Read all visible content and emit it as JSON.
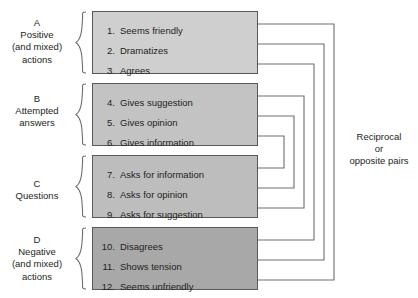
{
  "diagram": {
    "categories": [
      {
        "letter": "A",
        "lines": [
          "Positive",
          "(and mixed)",
          "actions"
        ],
        "box_color": "#cfcfcf"
      },
      {
        "letter": "B",
        "lines": [
          "Attempted",
          "answers"
        ],
        "box_color": "#c3c3c3"
      },
      {
        "letter": "C",
        "lines": [
          "Questions"
        ],
        "box_color": "#bdbdbd"
      },
      {
        "letter": "D",
        "lines": [
          "Negative",
          "(and mixed)",
          "actions"
        ],
        "box_color": "#a8a8a8"
      }
    ],
    "items": [
      {
        "number": "1.",
        "label": "Seems friendly"
      },
      {
        "number": "2.",
        "label": "Dramatizes"
      },
      {
        "number": "3.",
        "label": "Agrees"
      },
      {
        "number": "4.",
        "label": "Gives suggestion"
      },
      {
        "number": "5.",
        "label": "Gives opinion"
      },
      {
        "number": "6.",
        "label": "Gives information"
      },
      {
        "number": "7.",
        "label": "Asks for information"
      },
      {
        "number": "8.",
        "label": "Asks for opinion"
      },
      {
        "number": "9.",
        "label": "Asks for suggestion"
      },
      {
        "number": "10.",
        "label": "Disagrees"
      },
      {
        "number": "11.",
        "label": "Shows tension"
      },
      {
        "number": "12.",
        "label": "Seems unfriendly"
      }
    ],
    "pairs_caption": {
      "line1": "Reciprocal",
      "line2": "or",
      "line3": "opposite pairs"
    },
    "reciprocal_pairs": [
      {
        "from": "1",
        "to": "12"
      },
      {
        "from": "2",
        "to": "11"
      },
      {
        "from": "3",
        "to": "10"
      },
      {
        "from": "4",
        "to": "9"
      },
      {
        "from": "5",
        "to": "8"
      },
      {
        "from": "6",
        "to": "7"
      }
    ],
    "colors": {
      "line": "#6d6e71",
      "border": "#58595b",
      "text": "#231f20",
      "background": "#ffffff"
    }
  }
}
